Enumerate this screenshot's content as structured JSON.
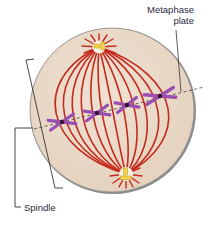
{
  "diagram": {
    "labels": {
      "metaphase_plate_line1": "Metaphase",
      "metaphase_plate_line2": "plate",
      "spindle": "Spindle"
    },
    "colors": {
      "cytoplasm": "#ecdccb",
      "membrane": "#7d7d7d",
      "spindle_fiber": "#c42a1e",
      "chromosome": "#9a4fb0",
      "centromere": "#3a1030",
      "centrosome": "#f3d34a",
      "leader_line": "#333333"
    },
    "chromosomes": [
      {
        "x": 62,
        "y": 122
      },
      {
        "x": 97,
        "y": 113
      },
      {
        "x": 127,
        "y": 105
      },
      {
        "x": 160,
        "y": 96
      }
    ],
    "poles": {
      "top": {
        "x": 99,
        "y": 47
      },
      "bottom": {
        "x": 126,
        "y": 174
      }
    }
  }
}
